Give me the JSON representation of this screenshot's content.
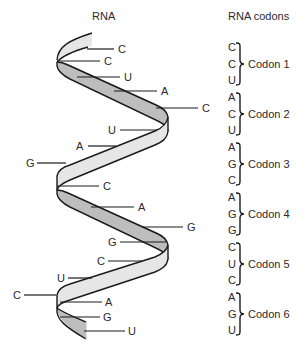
{
  "titles": {
    "left": "RNA",
    "right": "RNA codons"
  },
  "colors": {
    "ribbon_dark": "#bdbdbd",
    "ribbon_light": "#e6e6e6",
    "outline": "#1a1a1a",
    "text": "#2a2a2a"
  },
  "helix_bases": [
    {
      "base": "C",
      "x": 118,
      "y": 53
    },
    {
      "base": "C",
      "x": 104,
      "y": 65
    },
    {
      "base": "U",
      "x": 124,
      "y": 81
    },
    {
      "base": "A",
      "x": 161,
      "y": 95
    },
    {
      "base": "C",
      "x": 202,
      "y": 112
    },
    {
      "base": "U",
      "x": 108,
      "y": 134
    },
    {
      "base": "A",
      "x": 76,
      "y": 150
    },
    {
      "base": "G",
      "x": 26,
      "y": 167
    },
    {
      "base": "C",
      "x": 103,
      "y": 190
    },
    {
      "base": "A",
      "x": 138,
      "y": 211
    },
    {
      "base": "G",
      "x": 187,
      "y": 231
    },
    {
      "base": "G",
      "x": 106,
      "y": 246
    },
    {
      "base": "C",
      "x": 96,
      "y": 265
    },
    {
      "base": "U",
      "x": 56,
      "y": 282
    },
    {
      "base": "C",
      "x": 12,
      "y": 299
    },
    {
      "base": "A",
      "x": 106,
      "y": 306
    },
    {
      "base": "G",
      "x": 104,
      "y": 321
    },
    {
      "base": "U",
      "x": 129,
      "y": 335
    }
  ],
  "codons": [
    {
      "label": "Codon 1",
      "bases": [
        "C",
        "C",
        "U"
      ]
    },
    {
      "label": "Codon 2",
      "bases": [
        "A",
        "C",
        "U"
      ]
    },
    {
      "label": "Codon 3",
      "bases": [
        "A",
        "G",
        "C"
      ]
    },
    {
      "label": "Codon 4",
      "bases": [
        "A",
        "G",
        "G"
      ]
    },
    {
      "label": "Codon 5",
      "bases": [
        "C",
        "U",
        "C"
      ]
    },
    {
      "label": "Codon 6",
      "bases": [
        "A",
        "G",
        "U"
      ]
    }
  ]
}
